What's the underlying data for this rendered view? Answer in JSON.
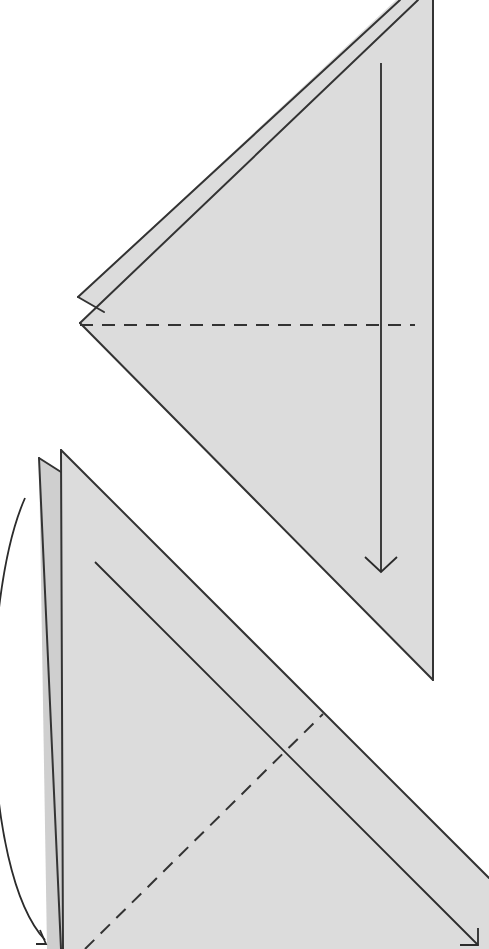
{
  "canvas": {
    "width": 489,
    "height": 949,
    "background": "#ffffff"
  },
  "colors": {
    "paper": "#dcdcdc",
    "paper_back": "#cfcfcf",
    "stroke": "#333333",
    "arrow": "#2b2b2b"
  },
  "steps": [
    {
      "id": "step-upper",
      "layers": [
        {
          "name": "back-flap",
          "points": "78,297 396,0 418,0 104,312"
        },
        {
          "name": "front-triangle",
          "points": "80,323 418,0 433,0 433,680"
        }
      ],
      "edges": [
        {
          "x1": 78,
          "y1": 297,
          "x2": 400,
          "y2": 0
        },
        {
          "x1": 78,
          "y1": 297,
          "x2": 104,
          "y2": 312
        },
        {
          "x1": 80,
          "y1": 323,
          "x2": 418,
          "y2": 0
        },
        {
          "x1": 80,
          "y1": 323,
          "x2": 433,
          "y2": 680
        },
        {
          "x1": 433,
          "y1": 0,
          "x2": 433,
          "y2": 680
        }
      ],
      "valley_fold": {
        "x1": 80,
        "y1": 325,
        "x2": 415,
        "y2": 325
      },
      "arrow": {
        "x1": 381,
        "y1": 63,
        "x2": 381,
        "y2": 572,
        "head": "365,557 381,572 397,557"
      }
    },
    {
      "id": "step-lower",
      "layers": [
        {
          "name": "back-sliver",
          "points": "39,458 61,472 63,949 47,949"
        },
        {
          "name": "front-triangle",
          "points": "61,450 489,878 489,949 63,949"
        }
      ],
      "edges": [
        {
          "x1": 39,
          "y1": 458,
          "x2": 61,
          "y2": 472
        },
        {
          "x1": 39,
          "y1": 458,
          "x2": 61,
          "y2": 949
        },
        {
          "x1": 61,
          "y1": 450,
          "x2": 63,
          "y2": 949
        },
        {
          "x1": 61,
          "y1": 450,
          "x2": 489,
          "y2": 878
        }
      ],
      "valley_fold": {
        "x1": 85,
        "y1": 949,
        "x2": 323,
        "y2": 714
      },
      "arrow": {
        "x1": 95,
        "y1": 562,
        "x2": 478,
        "y2": 945,
        "head": "460,945 478,945 478,928"
      },
      "curved_arrow": {
        "d": "M 25 498 C -20 600, -20 870, 45 940",
        "head": "40,930 46,944 36,944"
      }
    }
  ]
}
